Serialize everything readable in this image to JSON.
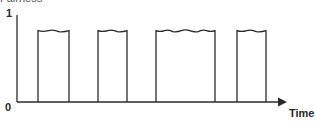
{
  "chart_data": {
    "type": "line",
    "subtype": "pulse-train",
    "title": "",
    "xlabel": "Time",
    "ylabel": "",
    "y_ticks": [
      "0",
      "1"
    ],
    "ylim": [
      0,
      1
    ],
    "grid": false,
    "legend": null,
    "top_cropped_text": "Fairness",
    "pulses": [
      {
        "start_px": 38,
        "end_px": 69,
        "level": 0.82
      },
      {
        "start_px": 98,
        "end_px": 127,
        "level": 0.82
      },
      {
        "start_px": 156,
        "end_px": 215,
        "level": 0.82
      },
      {
        "start_px": 237,
        "end_px": 266,
        "level": 0.82
      }
    ],
    "baseline_level": 0,
    "annotations": [
      "pulse tops drawn wavy / torn"
    ]
  },
  "labels": {
    "y_max": "1",
    "y_min": "0",
    "x_axis": "Time",
    "top_cropped": "Fairness"
  },
  "colors": {
    "stroke": "#2a2a2a",
    "background": "#ffffff"
  }
}
